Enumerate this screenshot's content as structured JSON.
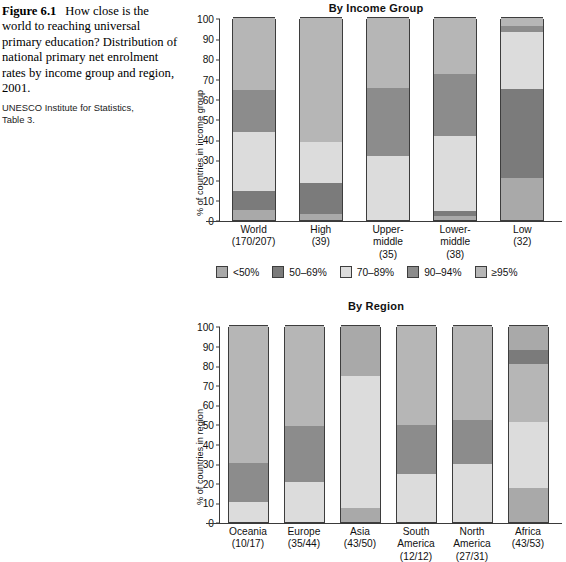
{
  "caption": {
    "figure_number": "Figure 6.1",
    "title": "How close is the world to reaching universal primary education? Distribution of national primary net enrolment rates by income group and region, 2001.",
    "source_line1": "UNESCO Institute for Statistics,",
    "source_line2": "Table 3."
  },
  "legend": {
    "items": [
      {
        "label": "<50%",
        "color": "#a9a9a9"
      },
      {
        "label": "50–69%",
        "color": "#7b7b7b"
      },
      {
        "label": "70–89%",
        "color": "#dcdcdc"
      },
      {
        "label": "90–94%",
        "color": "#8c8c8c"
      },
      {
        "label": "≥95%",
        "color": "#b6b6b6"
      }
    ]
  },
  "charts": [
    {
      "id": "by-income-group",
      "title": "By Income Group",
      "ylabel": "% of countries in income group"
    },
    {
      "id": "by-region",
      "title": "By Region",
      "ylabel": "% of countries in region"
    }
  ],
  "chart_data": [
    {
      "type": "bar",
      "subtype": "stacked-percent",
      "title": "By Income Group",
      "xlabel": "",
      "ylabel": "% of countries in income group",
      "ylim": [
        0,
        100
      ],
      "yticks": [
        0,
        10,
        20,
        30,
        40,
        50,
        60,
        70,
        80,
        90,
        100
      ],
      "grid": false,
      "legend_position": "below-plot-center",
      "categories": [
        "World",
        "High",
        "Upper-middle",
        "Lower-middle",
        "Low"
      ],
      "category_sublabels": [
        "(170/207)",
        "(39)",
        "(35)",
        "(38)",
        "(32)"
      ],
      "series": [
        {
          "name": "<50%",
          "color": "#a9a9a9",
          "values": [
            5.0,
            3.0,
            0.0,
            2.0,
            21.0
          ]
        },
        {
          "name": "50–69%",
          "color": "#7b7b7b",
          "values": [
            9.5,
            15.5,
            0.0,
            2.5,
            44.0
          ]
        },
        {
          "name": "70–89%",
          "color": "#dcdcdc",
          "values": [
            29.0,
            20.0,
            31.5,
            37.0,
            28.0
          ]
        },
        {
          "name": "90–94%",
          "color": "#8c8c8c",
          "values": [
            21.0,
            0.0,
            34.0,
            31.0,
            3.0
          ]
        },
        {
          "name": "≥95%",
          "color": "#b6b6b6",
          "values": [
            35.5,
            61.5,
            34.5,
            27.5,
            4.0
          ]
        }
      ]
    },
    {
      "type": "bar",
      "subtype": "stacked-percent",
      "title": "By Region",
      "xlabel": "",
      "ylabel": "% of countries in region",
      "ylim": [
        0,
        100
      ],
      "yticks": [
        0,
        10,
        20,
        30,
        40,
        50,
        60,
        70,
        80,
        90,
        100
      ],
      "grid": false,
      "legend_position": "shared-above",
      "categories": [
        "Oceania",
        "Europe",
        "Asia",
        "South America",
        "North America",
        "Africa"
      ],
      "category_sublabels": [
        "(10/17)",
        "(35/44)",
        "(43/50)",
        "(12/12)",
        "(27/31)",
        "(43/53)"
      ],
      "series": [
        {
          "name": "<50%",
          "color": "#a9a9a9",
          "values": [
            0.0,
            0.0,
            7.0,
            0.0,
            0.0,
            17.5
          ]
        },
        {
          "name": "50–69%",
          "color": "#7b7b7b",
          "values": [
            0.0,
            0.0,
            0.0,
            0.0,
            0.0,
            0.0
          ]
        },
        {
          "name": "70–89%",
          "color": "#dcdcdc",
          "values": [
            10.0,
            20.5,
            39.5,
            24.5,
            29.5,
            33.5
          ]
        },
        {
          "name": "90–94%",
          "color": "#8c8c8c",
          "values": [
            20.0,
            28.5,
            0.0,
            25.0,
            22.5,
            0.0
          ]
        },
        {
          "name": "≥95%",
          "color": "#b6b6b6",
          "values": [
            70.0,
            51.0,
            25.5,
            50.5,
            48.0,
            31.5
          ]
        }
      ],
      "extra_segments": {
        "Asia": [
          {
            "from": 46.5,
            "to": 74.5,
            "color": "#dcdcdc"
          },
          {
            "from": 74.5,
            "to": 100,
            "color": "#a9a9a9"
          }
        ],
        "Africa": [
          {
            "from": 80.5,
            "to": 88.0,
            "color": "#7b7b7b"
          },
          {
            "from": 88.0,
            "to": 100,
            "color": "#a9a9a9"
          }
        ]
      }
    }
  ]
}
